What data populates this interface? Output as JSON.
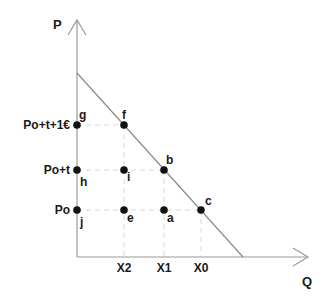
{
  "diagram": {
    "axes": {
      "y_label": "P",
      "x_label": "Q"
    },
    "price_levels": [
      {
        "id": "p_high",
        "label": "Po+t+1€"
      },
      {
        "id": "p_mid",
        "label": "Po+t"
      },
      {
        "id": "p_low",
        "label": "Po"
      }
    ],
    "quantity_levels": [
      {
        "id": "x2",
        "label": "X2"
      },
      {
        "id": "x1",
        "label": "X1"
      },
      {
        "id": "x0",
        "label": "X0"
      }
    ],
    "points": [
      {
        "name": "g",
        "label": "g",
        "price": "Po+t+1€",
        "quantity": "0"
      },
      {
        "name": "f",
        "label": "f",
        "price": "Po+t+1€",
        "quantity": "X2"
      },
      {
        "name": "h",
        "label": "h",
        "price": "Po+t",
        "quantity": "0"
      },
      {
        "name": "i",
        "label": "i",
        "price": "Po+t",
        "quantity": "X2"
      },
      {
        "name": "b",
        "label": "b",
        "price": "Po+t",
        "quantity": "X1"
      },
      {
        "name": "j",
        "label": "j",
        "price": "Po",
        "quantity": "0"
      },
      {
        "name": "e",
        "label": "e",
        "price": "Po",
        "quantity": "X2"
      },
      {
        "name": "a",
        "label": "a",
        "price": "Po",
        "quantity": "X1"
      },
      {
        "name": "c",
        "label": "c",
        "price": "Po",
        "quantity": "X0"
      }
    ],
    "colors": {
      "axis": "#9a9a9a",
      "demand_line": "#8a8a8a",
      "guide": "#d8d8d8",
      "point": "#111111",
      "text": "#1a1a1a"
    }
  }
}
